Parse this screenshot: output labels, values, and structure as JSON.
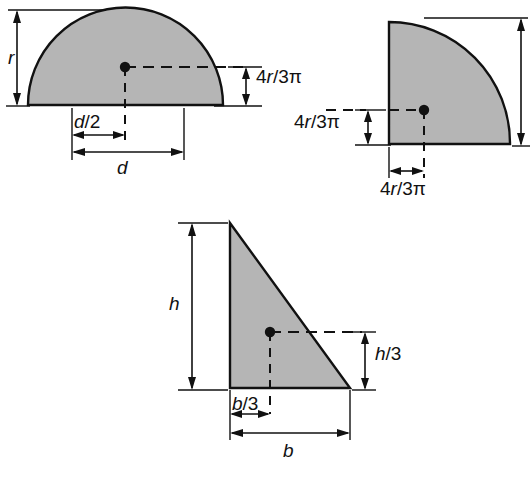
{
  "figure": {
    "background_color": "#ffffff",
    "fill_color": "#b5b5b5",
    "line_color": "#111111",
    "shapes": [
      {
        "name": "semicircle",
        "label_vertical": "r",
        "label_base_half": "d/2",
        "label_base_full": "d",
        "label_centroid_height": "4r/3π"
      },
      {
        "name": "quarter-circle",
        "label_centroid_vertical": "4r/3π",
        "label_centroid_horizontal": "4r/3π"
      },
      {
        "name": "right-triangle",
        "label_height": "h",
        "label_centroid_height": "h/3",
        "label_centroid_base": "b/3",
        "label_base": "b"
      }
    ]
  },
  "labels": {
    "r": "r",
    "d_half_num": "d",
    "d_half_den": "/2",
    "d": "d",
    "four_r_num": "4",
    "four_r_var": "r",
    "four_r_den": "/3π",
    "h": "h",
    "h_third_var": "h",
    "h_third_den": "/3",
    "b_third_var": "b",
    "b_third_den": "/3",
    "b": "b"
  }
}
